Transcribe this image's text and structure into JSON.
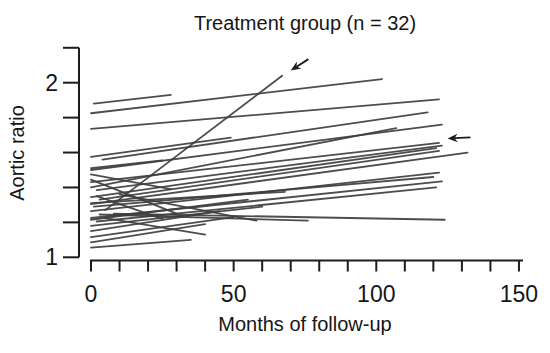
{
  "figure": {
    "background_color": "#ffffff"
  },
  "chart_data": {
    "type": "line",
    "title": "Treatment group (n = 32)",
    "xlabel": "Months of follow-up",
    "ylabel": "Aortic ratio",
    "n_patients": 32,
    "colors": {
      "patient_line": "#3e3e3e",
      "axis": "#1c1c1c",
      "text": "#161616",
      "background": "#ffffff"
    },
    "x_axis": {
      "min": 0,
      "max": 150,
      "minor_tick_step": 10,
      "labeled_ticks": [
        {
          "value": 0,
          "label": "0"
        },
        {
          "value": 50,
          "label": "50"
        },
        {
          "value": 100,
          "label": "100"
        },
        {
          "value": 150,
          "label": "150"
        }
      ]
    },
    "y_axis": {
      "min": 1,
      "max": 2.2,
      "minor_tick_step": 0.2,
      "labeled_ticks": [
        {
          "value": 1,
          "label": "1"
        },
        {
          "value": 2,
          "label": "2"
        }
      ]
    },
    "series": [
      {
        "points": [
          [
            1,
            1.88
          ],
          [
            28,
            1.93
          ]
        ]
      },
      {
        "points": [
          [
            0,
            1.825
          ],
          [
            102,
            2.02
          ]
        ]
      },
      {
        "points": [
          [
            0,
            1.735
          ],
          [
            122,
            1.905
          ]
        ]
      },
      {
        "points": [
          [
            4,
            1.56
          ],
          [
            118,
            1.83
          ]
        ]
      },
      {
        "points": [
          [
            5,
            1.27
          ],
          [
            67,
            2.04
          ]
        ]
      },
      {
        "points": [
          [
            0,
            1.4
          ],
          [
            107,
            1.74
          ]
        ]
      },
      {
        "points": [
          [
            0,
            1.5
          ],
          [
            123,
            1.76
          ]
        ]
      },
      {
        "points": [
          [
            0,
            1.43
          ],
          [
            122,
            1.655
          ]
        ]
      },
      {
        "points": [
          [
            2,
            1.385
          ],
          [
            123,
            1.64
          ]
        ]
      },
      {
        "points": [
          [
            0,
            1.345
          ],
          [
            121,
            1.625
          ]
        ]
      },
      {
        "points": [
          [
            3,
            1.33
          ],
          [
            122,
            1.61
          ]
        ]
      },
      {
        "points": [
          [
            0,
            1.305
          ],
          [
            132,
            1.6
          ]
        ]
      },
      {
        "points": [
          [
            0,
            1.265
          ],
          [
            122,
            1.485
          ]
        ]
      },
      {
        "points": [
          [
            1,
            1.29
          ],
          [
            120,
            1.46
          ]
        ]
      },
      {
        "points": [
          [
            0,
            1.225
          ],
          [
            123,
            1.435
          ]
        ]
      },
      {
        "points": [
          [
            2,
            1.205
          ],
          [
            121,
            1.4
          ]
        ]
      },
      {
        "points": [
          [
            8,
            1.25
          ],
          [
            124,
            1.215
          ]
        ]
      },
      {
        "points": [
          [
            0,
            1.575
          ],
          [
            49,
            1.685
          ]
        ]
      },
      {
        "points": [
          [
            0,
            1.51
          ],
          [
            25,
            1.555
          ]
        ]
      },
      {
        "points": [
          [
            0,
            1.475
          ],
          [
            28,
            1.39
          ]
        ]
      },
      {
        "points": [
          [
            0,
            1.445
          ],
          [
            30,
            1.25
          ]
        ]
      },
      {
        "points": [
          [
            2,
            1.35
          ],
          [
            25,
            1.22
          ]
        ]
      },
      {
        "points": [
          [
            10,
            1.36
          ],
          [
            58,
            1.21
          ]
        ]
      },
      {
        "points": [
          [
            3,
            1.245
          ],
          [
            76,
            1.21
          ]
        ]
      },
      {
        "points": [
          [
            0,
            1.31
          ],
          [
            68,
            1.375
          ]
        ]
      },
      {
        "points": [
          [
            0,
            1.215
          ],
          [
            55,
            1.33
          ]
        ]
      },
      {
        "points": [
          [
            0,
            1.18
          ],
          [
            60,
            1.29
          ]
        ]
      },
      {
        "points": [
          [
            0,
            1.15
          ],
          [
            45,
            1.265
          ]
        ]
      },
      {
        "points": [
          [
            0,
            1.115
          ],
          [
            50,
            1.23
          ]
        ]
      },
      {
        "points": [
          [
            0,
            1.085
          ],
          [
            40,
            1.19
          ]
        ]
      },
      {
        "points": [
          [
            5,
            1.225
          ],
          [
            40,
            1.13
          ]
        ]
      },
      {
        "points": [
          [
            0,
            1.055
          ],
          [
            35,
            1.1
          ]
        ]
      }
    ],
    "annotations": [
      {
        "type": "arrow",
        "direction": "down-left",
        "tip_xy": [
          70,
          2.07
        ],
        "tail_xy": [
          76.2,
          2.135
        ]
      },
      {
        "type": "arrow",
        "direction": "left",
        "tip_xy": [
          125,
          1.68
        ],
        "tail_xy": [
          133,
          1.687
        ]
      }
    ]
  }
}
